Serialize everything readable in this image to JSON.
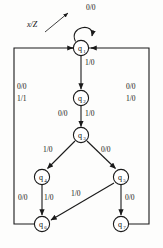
{
  "diagram": {
    "type": "mealy-state-transition-diagram",
    "legend": {
      "notation": "x/Z",
      "points_to": "0/0"
    },
    "states": [
      {
        "id": "q1",
        "name": "q",
        "subscript": "1",
        "cx": 81,
        "cy": 48
      },
      {
        "id": "q2",
        "name": "q",
        "subscript": "2",
        "cx": 81,
        "cy": 98
      },
      {
        "id": "q3",
        "name": "q",
        "subscript": "3",
        "cx": 81,
        "cy": 135
      },
      {
        "id": "q4",
        "name": "q",
        "subscript": "4",
        "cx": 42,
        "cy": 177
      },
      {
        "id": "q5",
        "name": "q",
        "subscript": "5",
        "cx": 121,
        "cy": 177
      },
      {
        "id": "q6",
        "name": "q",
        "subscript": "6",
        "cx": 42,
        "cy": 224
      },
      {
        "id": "q7",
        "name": "q",
        "subscript": "7",
        "cx": 121,
        "cy": 224
      }
    ],
    "transitions": [
      {
        "id": "t-q1-self",
        "from": "q1",
        "to": "q1",
        "label": "0/0",
        "lx": 86,
        "ly": 7
      },
      {
        "id": "t-q1-q2",
        "from": "q1",
        "to": "q2",
        "label": "1/0",
        "lx": 85,
        "ly": 62
      },
      {
        "id": "t-q2-q3-a",
        "from": "q2",
        "to": "q3",
        "label": "0/0",
        "lx": 58,
        "ly": 113
      },
      {
        "id": "t-q2-q3-b",
        "from": "q2",
        "to": "q3",
        "label": "1/0",
        "lx": 85,
        "ly": 113
      },
      {
        "id": "t-q3-q4",
        "from": "q3",
        "to": "q4",
        "label": "1/0",
        "lx": 45,
        "ly": 150
      },
      {
        "id": "t-q3-q5",
        "from": "q3",
        "to": "q5",
        "label": "0/0",
        "lx": 103,
        "ly": 150
      },
      {
        "id": "t-q4-q6-a",
        "from": "q4",
        "to": "q6",
        "label": "0/0",
        "lx": 19,
        "ly": 196
      },
      {
        "id": "t-q4-q6-b",
        "from": "q4",
        "to": "q6",
        "label": "1/0",
        "lx": 45,
        "ly": 196
      },
      {
        "id": "t-q5-q6",
        "from": "q5",
        "to": "q6",
        "label": "1/0",
        "lx": 72,
        "ly": 192
      },
      {
        "id": "t-q5-q7",
        "from": "q5",
        "to": "q7",
        "label": "0/0",
        "lx": 126,
        "ly": 196
      },
      {
        "id": "t-q6-q1-a",
        "from": "q6",
        "to": "q1",
        "label": "0/0",
        "lx": 18,
        "ly": 86
      },
      {
        "id": "t-q6-q1-b",
        "from": "q6",
        "to": "q1",
        "label": "1/1",
        "lx": 18,
        "ly": 98
      },
      {
        "id": "t-q7-q1-a",
        "from": "q7",
        "to": "q1",
        "label": "0/0",
        "lx": 127,
        "ly": 86
      },
      {
        "id": "t-q7-q1-b",
        "from": "q7",
        "to": "q1",
        "label": "1/0",
        "lx": 127,
        "ly": 98
      }
    ]
  }
}
